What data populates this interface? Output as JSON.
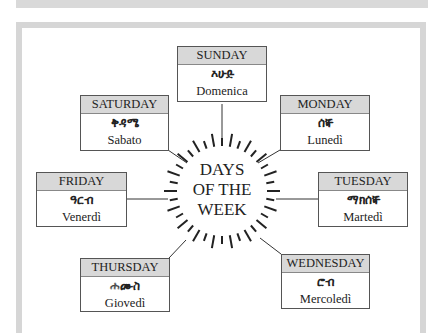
{
  "title": "DAYS OF THE WEEK",
  "center": {
    "line1": "DAYS",
    "line2": "OF THE",
    "line3": "WEEK"
  },
  "days": [
    {
      "english": "SUNDAY",
      "amharic": "እሁድ",
      "italian": "Domenica"
    },
    {
      "english": "MONDAY",
      "amharic": "ሰኞ",
      "italian": "Lunedì"
    },
    {
      "english": "TUESDAY",
      "amharic": "ማክሰኞ",
      "italian": "Martedì"
    },
    {
      "english": "WEDNESDAY",
      "amharic": "ሮብ",
      "italian": "Mercoledì"
    },
    {
      "english": "THURSDAY",
      "amharic": "ሐሙስ",
      "italian": "Giovedì"
    },
    {
      "english": "FRIDAY",
      "amharic": "ዓርብ",
      "italian": "Venerdì"
    },
    {
      "english": "SATURDAY",
      "amharic": "ቅዳሜ",
      "italian": "Sabato"
    }
  ],
  "colors": {
    "header_fill": "#d8d8d8",
    "frame": "#d6d6d6",
    "border": "#555555"
  }
}
